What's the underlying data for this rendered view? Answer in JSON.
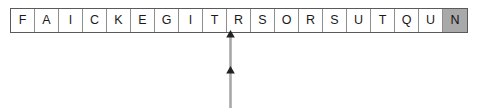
{
  "figure": {
    "name": "letter-sequence-strip-with-pointer",
    "strip": {
      "cell_count": 20,
      "cells": [
        {
          "letter": "F",
          "highlighted": false
        },
        {
          "letter": "A",
          "highlighted": false
        },
        {
          "letter": "I",
          "highlighted": false
        },
        {
          "letter": "C",
          "highlighted": false
        },
        {
          "letter": "K",
          "highlighted": false
        },
        {
          "letter": "E",
          "highlighted": false
        },
        {
          "letter": "G",
          "highlighted": false
        },
        {
          "letter": "I",
          "highlighted": false
        },
        {
          "letter": "T",
          "highlighted": false
        },
        {
          "letter": "R",
          "highlighted": false
        },
        {
          "letter": "S",
          "highlighted": false
        },
        {
          "letter": "O",
          "highlighted": false
        },
        {
          "letter": "R",
          "highlighted": false
        },
        {
          "letter": "S",
          "highlighted": false
        },
        {
          "letter": "U",
          "highlighted": false
        },
        {
          "letter": "T",
          "highlighted": false
        },
        {
          "letter": "Q",
          "highlighted": false
        },
        {
          "letter": "U",
          "highlighted": false
        },
        {
          "letter": "N",
          "highlighted": true
        }
      ]
    },
    "pointer": {
      "label": "",
      "points_to_letter": "T",
      "points_to_index": 8,
      "direction": "up",
      "arrowheads": 2
    },
    "colors": {
      "cell_background": "#ffffff",
      "cell_highlight": "#a9a9a9",
      "cell_border": "#8e8e8e",
      "strip_border": "#5a5a5a",
      "text": "#1a1a1a",
      "arrow_shaft": "#a8a8a8",
      "arrow_head": "#222222"
    }
  }
}
